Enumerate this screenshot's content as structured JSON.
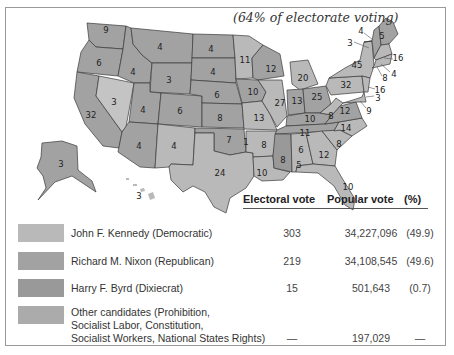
{
  "subtitle": "(64% of electorate voting)",
  "colors": {
    "kennedy": "#b9b9b9",
    "nixon": "#a2a2a2",
    "byrd": "#999999",
    "other": "#ababab",
    "nevada_kennedy_light": "#c4c4c4"
  },
  "table": {
    "headers": {
      "electoral": "Electoral vote",
      "popular": "Popular vote",
      "pct": "(%)"
    },
    "rows": [
      {
        "candidate": "John F. Kennedy (Democratic)",
        "electoral": "303",
        "popular": "34,227,096",
        "pct": "(49.9)"
      },
      {
        "candidate": "Richard M. Nixon (Republican)",
        "electoral": "219",
        "popular": "34,108,545",
        "pct": "(49.6)"
      },
      {
        "candidate": "Harry F. Byrd (Dixiecrat)",
        "electoral": "15",
        "popular": "501,643",
        "pct": "(0.7)"
      },
      {
        "candidate_lines": [
          "Other candidates (Prohibition,",
          "Socialist Labor, Constitution,",
          "Socialist Workers, National States Rights)"
        ],
        "electoral": "—",
        "popular": "197,029",
        "pct": "—"
      }
    ]
  },
  "map": {
    "state_labels": [
      {
        "v": "9",
        "x": 106,
        "y": 30
      },
      {
        "v": "6",
        "x": 99,
        "y": 63
      },
      {
        "v": "4",
        "x": 133,
        "y": 72
      },
      {
        "v": "4",
        "x": 160,
        "y": 47
      },
      {
        "v": "3",
        "x": 169,
        "y": 80
      },
      {
        "v": "3",
        "x": 114,
        "y": 102
      },
      {
        "v": "32",
        "x": 91,
        "y": 115
      },
      {
        "v": "4",
        "x": 143,
        "y": 110
      },
      {
        "v": "6",
        "x": 180,
        "y": 111
      },
      {
        "v": "4",
        "x": 139,
        "y": 146
      },
      {
        "v": "4",
        "x": 174,
        "y": 146
      },
      {
        "v": "4",
        "x": 211,
        "y": 49
      },
      {
        "v": "4",
        "x": 213,
        "y": 72
      },
      {
        "v": "6",
        "x": 217,
        "y": 95
      },
      {
        "v": "8",
        "x": 220,
        "y": 118
      },
      {
        "v": "7",
        "x": 229,
        "y": 140
      },
      {
        "v": "1",
        "x": 246,
        "y": 142
      },
      {
        "v": "24",
        "x": 220,
        "y": 173
      },
      {
        "v": "11",
        "x": 245,
        "y": 60
      },
      {
        "v": "12",
        "x": 271,
        "y": 69
      },
      {
        "v": "10",
        "x": 253,
        "y": 92
      },
      {
        "v": "27",
        "x": 280,
        "y": 103
      },
      {
        "v": "13",
        "x": 259,
        "y": 118
      },
      {
        "v": "8",
        "x": 264,
        "y": 145
      },
      {
        "v": "10",
        "x": 262,
        "y": 173
      },
      {
        "v": "20",
        "x": 303,
        "y": 78
      },
      {
        "v": "13",
        "x": 297,
        "y": 101
      },
      {
        "v": "25",
        "x": 317,
        "y": 97
      },
      {
        "v": "10",
        "x": 310,
        "y": 119
      },
      {
        "v": "11",
        "x": 305,
        "y": 133
      },
      {
        "v": "8",
        "x": 283,
        "y": 160
      },
      {
        "v": "6",
        "x": 301,
        "y": 150
      },
      {
        "v": "5",
        "x": 299,
        "y": 165
      },
      {
        "v": "12",
        "x": 324,
        "y": 155
      },
      {
        "v": "8",
        "x": 339,
        "y": 144
      },
      {
        "v": "14",
        "x": 346,
        "y": 128
      },
      {
        "v": "12",
        "x": 345,
        "y": 111
      },
      {
        "v": "8",
        "x": 331,
        "y": 116
      },
      {
        "v": "32",
        "x": 346,
        "y": 85
      },
      {
        "v": "45",
        "x": 357,
        "y": 65
      },
      {
        "v": "10",
        "x": 348,
        "y": 187
      },
      {
        "v": "3",
        "x": 61,
        "y": 164
      },
      {
        "v": "3",
        "x": 139,
        "y": 196
      }
    ],
    "leader_labels": [
      {
        "v": "4",
        "x": 361,
        "y": 31
      },
      {
        "v": "5",
        "x": 382,
        "y": 36
      },
      {
        "v": "3",
        "x": 350,
        "y": 43
      },
      {
        "v": "16",
        "x": 398,
        "y": 58
      },
      {
        "v": "4",
        "x": 394,
        "y": 74
      },
      {
        "v": "8",
        "x": 385,
        "y": 78
      },
      {
        "v": "16",
        "x": 380,
        "y": 90
      },
      {
        "v": "3",
        "x": 378,
        "y": 98
      },
      {
        "v": "9",
        "x": 369,
        "y": 111
      }
    ]
  }
}
